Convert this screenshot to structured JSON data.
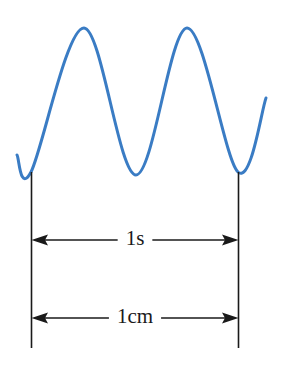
{
  "figure": {
    "background_color": "#ffffff",
    "width": 283,
    "height": 369
  },
  "wave": {
    "name": "sinusoidal-waveform",
    "color": "#3a7cc4",
    "stroke_width": 3,
    "cycles_shown": 2.25
  },
  "markers": {
    "left_reference_line_x": 31,
    "right_reference_line_x": 238,
    "line_color": "#1a1a1a",
    "line_top_y": 172,
    "line_bottom_y": 348
  },
  "dimensions": [
    {
      "id": "time-dimension",
      "label": "1s",
      "y": 240,
      "from_x": 31,
      "to_x": 238,
      "arrow_style": "double-headed"
    },
    {
      "id": "length-dimension",
      "label": "1cm",
      "y": 318,
      "from_x": 31,
      "to_x": 238,
      "arrow_style": "double-headed"
    }
  ],
  "chart_data": {
    "type": "line",
    "xlabel": "",
    "ylabel": "",
    "xlim": [
      0,
      283
    ],
    "ylim": [
      0,
      369
    ],
    "grid": false,
    "legend": null,
    "series": [
      {
        "name": "wave",
        "color": "#3a7cc4",
        "points": [
          {
            "x": 17,
            "y": 155
          },
          {
            "x": 31,
            "y": 172
          },
          {
            "x": 84,
            "y": 28
          },
          {
            "x": 136,
            "y": 175
          },
          {
            "x": 187,
            "y": 28
          },
          {
            "x": 238,
            "y": 172
          },
          {
            "x": 266,
            "y": 98
          }
        ]
      }
    ],
    "annotations": [
      {
        "text": "1s",
        "x": 134,
        "y": 240
      },
      {
        "text": "1cm",
        "x": 134,
        "y": 318
      }
    ]
  }
}
